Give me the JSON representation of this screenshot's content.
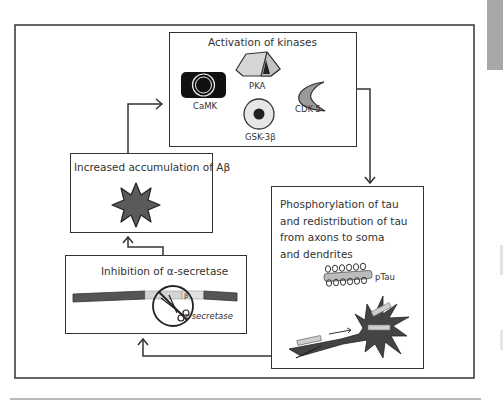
{
  "diagram": {
    "boxes": {
      "kinases": {
        "title": "Activation of kinases",
        "items": [
          {
            "label": "CaMK",
            "icon": "camk-icon"
          },
          {
            "label": "PKA",
            "icon": "tent-icon"
          },
          {
            "label": "GSK-3β",
            "icon": "gsk3b-icon"
          },
          {
            "label": "CDK-5",
            "icon": "crescent-icon"
          }
        ]
      },
      "tau": {
        "lines": [
          "Phosphorylation of tau",
          "and redistribution of tau",
          "from axons to soma",
          "and dendrites"
        ],
        "ptau_label": "pTau"
      },
      "secretase": {
        "title": "Inhibition of α-secretase",
        "scissor_label": "α-secretase",
        "beta_marker": "β"
      },
      "abeta": {
        "title": "Increased accumulation of Aβ"
      }
    },
    "flow": [
      "kinases",
      "tau",
      "secretase",
      "abeta",
      "kinases"
    ],
    "colors": {
      "line": "#333333",
      "fill_dark": "#4a4a4a",
      "fill_gray": "#8a8a8a",
      "fill_light": "#d0d0d0",
      "page_tab": "#a8a8a8",
      "rule": "#b9b9b9"
    }
  }
}
